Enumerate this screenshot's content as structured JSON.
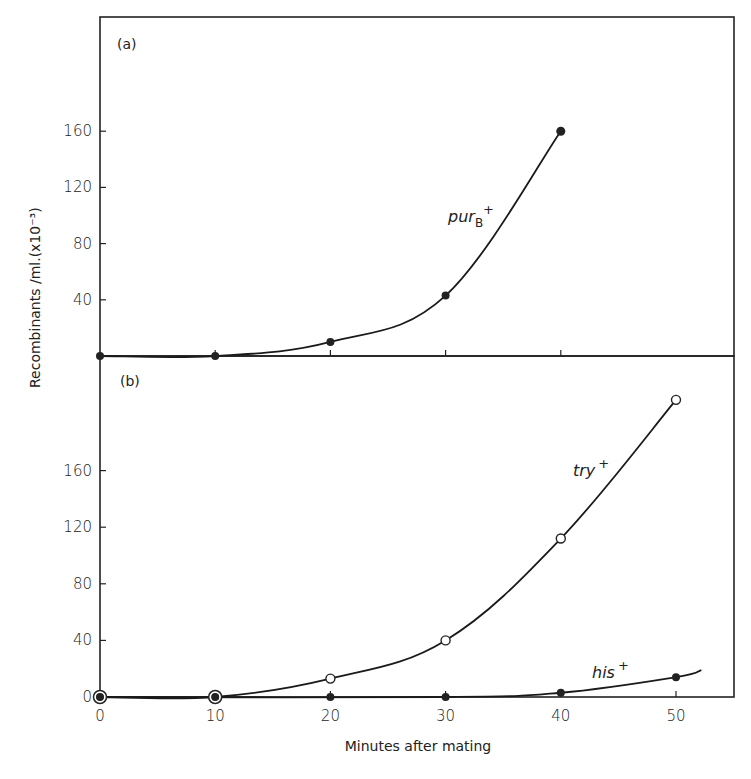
{
  "chart_data": [
    {
      "panel": "(a)",
      "type": "line",
      "xlabel": "Minutes after mating",
      "ylabel": "Recombinants /ml.(x10⁻³)",
      "xlim": [
        0,
        55
      ],
      "ylim": [
        0,
        200
      ],
      "yticks": [
        40,
        80,
        120,
        160
      ],
      "xticks": [
        10,
        20,
        30,
        40
      ],
      "series": [
        {
          "name": "purB+",
          "label_main": "pur",
          "label_sub": "B",
          "label_sup": "+",
          "marker": "filled",
          "x": [
            0,
            10,
            20,
            30,
            40
          ],
          "y": [
            0,
            0,
            10,
            43,
            160
          ]
        }
      ]
    },
    {
      "panel": "(b)",
      "type": "line",
      "xlabel": "Minutes after mating",
      "ylabel": "Recombinants /ml.(x10⁻³)",
      "xlim": [
        0,
        55
      ],
      "ylim": [
        0,
        210
      ],
      "yticks": [
        0,
        40,
        80,
        120,
        160
      ],
      "xticks": [
        0,
        10,
        20,
        30,
        40,
        50
      ],
      "series": [
        {
          "name": "try+",
          "label_main": "try",
          "label_sup": "+",
          "marker": "open",
          "x": [
            0,
            10,
            20,
            30,
            40,
            50
          ],
          "y": [
            0,
            0,
            13,
            40,
            112,
            210
          ]
        },
        {
          "name": "his+",
          "label_main": "his",
          "label_sup": "+",
          "marker": "filled",
          "x": [
            0,
            10,
            20,
            30,
            40,
            50
          ],
          "y": [
            0,
            0,
            0,
            0,
            3,
            14
          ]
        }
      ]
    }
  ],
  "labels": {
    "panel_a": "(a)",
    "panel_b": "(b)",
    "xlabel": "Minutes after mating",
    "ylabel": "Recombinants /ml.(x10⁻³)"
  }
}
